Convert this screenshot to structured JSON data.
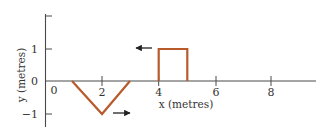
{
  "diagram": {
    "colors": {
      "axis": "#4a4a4a",
      "pulse": "#b85a2c",
      "arrow": "#222222",
      "text": "#333333"
    },
    "x_axis": {
      "label": "x (metres)",
      "origin_label": "0",
      "ticks": [
        "2",
        "4",
        "6",
        "8"
      ]
    },
    "y_axis": {
      "label": "y (metres)",
      "ticks": [
        "1",
        "0",
        "−1"
      ]
    },
    "pulses": [
      {
        "name": "triangular-pulse",
        "shape": "V (inverted triangle)",
        "x_start": 1,
        "x_min": 2,
        "x_end": 3,
        "y_min": -1,
        "direction": "right"
      },
      {
        "name": "rectangular-pulse",
        "shape": "rectangle",
        "x_start": 4,
        "x_end": 5,
        "height": 1,
        "direction": "left"
      }
    ]
  }
}
